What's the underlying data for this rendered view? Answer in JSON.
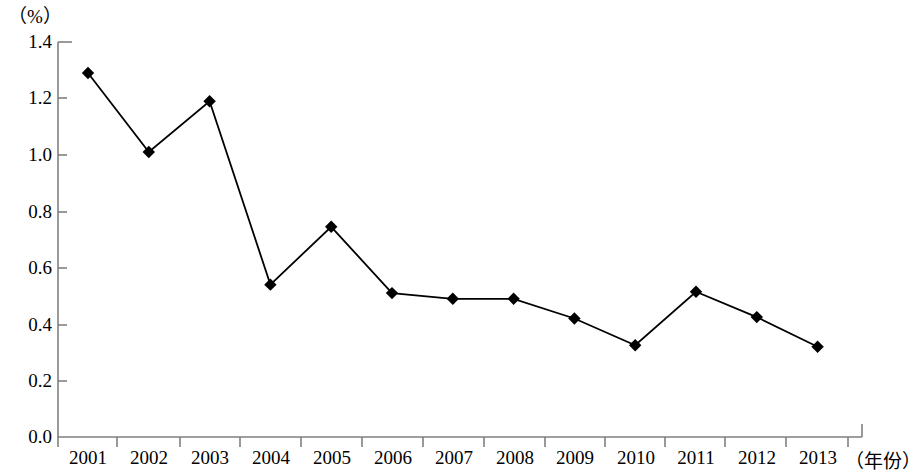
{
  "chart_data": {
    "type": "line",
    "title": "",
    "subtitle": "",
    "xlabel": "（年份）",
    "ylabel": "（%）",
    "unit_label": "（%）",
    "categories": [
      "2001",
      "2002",
      "2003",
      "2004",
      "2005",
      "2006",
      "2007",
      "2008",
      "2009",
      "2010",
      "2011",
      "2012",
      "2013"
    ],
    "values": [
      1.29,
      1.01,
      1.19,
      0.54,
      0.745,
      0.51,
      0.49,
      0.49,
      0.42,
      0.325,
      0.515,
      0.425,
      0.32
    ],
    "series": [
      {
        "name": "",
        "values": [
          1.29,
          1.01,
          1.19,
          0.54,
          0.745,
          0.51,
          0.49,
          0.49,
          0.42,
          0.325,
          0.515,
          0.425,
          0.32
        ]
      }
    ],
    "ylim": [
      0.0,
      1.4
    ],
    "ytick_values": [
      0.0,
      0.2,
      0.4,
      0.6,
      0.8,
      1.0,
      1.2,
      1.4
    ],
    "ytick_labels": [
      "0.0",
      "0.2",
      "0.4",
      "0.6",
      "0.8",
      "1.0",
      "1.2",
      "1.4"
    ],
    "grid": false,
    "legend": "none",
    "marker": "diamond",
    "line_color": "#000000",
    "marker_color": "#000000",
    "axis_color": "#808080"
  },
  "axis": {
    "y_ticks": [
      {
        "label": "1.4",
        "value": 1.4
      },
      {
        "label": "1.2",
        "value": 1.2
      },
      {
        "label": "1.0",
        "value": 1.0
      },
      {
        "label": "0.8",
        "value": 0.8
      },
      {
        "label": "0.6",
        "value": 0.6
      },
      {
        "label": "0.4",
        "value": 0.4
      },
      {
        "label": "0.2",
        "value": 0.2
      },
      {
        "label": "0.0",
        "value": 0.0
      }
    ],
    "x_ticks": [
      {
        "label": "2001"
      },
      {
        "label": "2002"
      },
      {
        "label": "2003"
      },
      {
        "label": "2004"
      },
      {
        "label": "2005"
      },
      {
        "label": "2006"
      },
      {
        "label": "2007"
      },
      {
        "label": "2008"
      },
      {
        "label": "2009"
      },
      {
        "label": "2010"
      },
      {
        "label": "2011"
      },
      {
        "label": "2012"
      },
      {
        "label": "2013"
      }
    ]
  }
}
